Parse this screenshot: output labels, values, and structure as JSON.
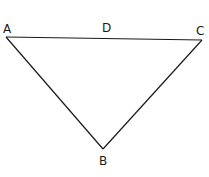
{
  "diagram": {
    "type": "triangle",
    "vertices": {
      "A": {
        "label": "A",
        "x": 6,
        "y": 37
      },
      "B": {
        "label": "B",
        "x": 103,
        "y": 149
      },
      "C": {
        "label": "C",
        "x": 202,
        "y": 40
      }
    },
    "points": {
      "D": {
        "label": "D",
        "x": 107,
        "y": 38,
        "on_segment": "AC"
      }
    },
    "segments": [
      "AC",
      "AB",
      "BC"
    ],
    "stroke_color": "#1a1a1a"
  }
}
